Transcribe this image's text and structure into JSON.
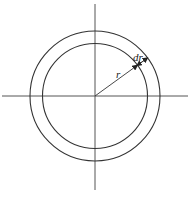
{
  "diagram": {
    "labels": {
      "radius": "r",
      "thickness": "dr"
    },
    "elements": [
      "horizontal-axis",
      "vertical-axis",
      "inner-circle",
      "outer-circle",
      "radius-line",
      "thickness-arrow"
    ],
    "colors": {
      "stroke": "#333333",
      "axis": "#555555",
      "background": "#ffffff"
    }
  }
}
